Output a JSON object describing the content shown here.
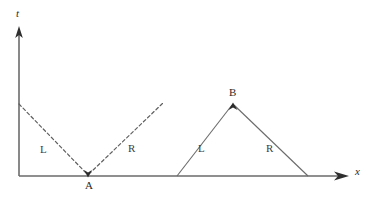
{
  "figure": {
    "type": "characteristics-diagram",
    "background_color": "#ffffff",
    "line_color": "#5a5a5a",
    "axis_color": "#4a4a4a",
    "text_color": "#2b2b2b"
  },
  "axes": {
    "vertical_label": "t",
    "horizontal_label": "x",
    "origin_px": {
      "x": 19,
      "y": 176
    },
    "vertical_arrow_tip_px": {
      "x": 19,
      "y": 30
    },
    "horizontal_arrow_tip_px": {
      "x": 348,
      "y": 176
    }
  },
  "points": [
    {
      "name": "A",
      "label": "A",
      "x_px": 88,
      "y_px": 176,
      "marker": "arrowhead-down",
      "label_position": "below"
    },
    {
      "name": "B",
      "label": "B",
      "x_px": 233,
      "y_px": 104,
      "marker": "arrowhead-up",
      "label_position": "above"
    }
  ],
  "curves": [
    {
      "name": "converging-characteristics",
      "style": "dashed",
      "vertex": "A",
      "branches": [
        {
          "label": "L",
          "from_px": {
            "x": 19,
            "y": 104
          },
          "to_px": {
            "x": 88,
            "y": 176
          }
        },
        {
          "label": "R",
          "from_px": {
            "x": 88,
            "y": 176
          },
          "to_px": {
            "x": 163,
            "y": 103
          }
        }
      ]
    },
    {
      "name": "diverging-characteristics",
      "style": "solid",
      "vertex": "B",
      "branches": [
        {
          "label": "L",
          "from_px": {
            "x": 177,
            "y": 176
          },
          "to_px": {
            "x": 233,
            "y": 104
          }
        },
        {
          "label": "R",
          "from_px": {
            "x": 233,
            "y": 104
          },
          "to_px": {
            "x": 308,
            "y": 176
          }
        }
      ]
    }
  ],
  "labels": {
    "t_axis": "t",
    "x_axis": "x",
    "point_a": "A",
    "point_b": "B",
    "left_dashed_branch": "L",
    "right_dashed_branch": "R",
    "left_solid_branch": "L",
    "right_solid_branch": "R"
  }
}
